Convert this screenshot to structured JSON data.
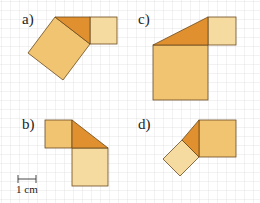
{
  "figure": {
    "grid": {
      "spacing_px": 9,
      "color": "#d9d9d9"
    },
    "colors": {
      "triangle": "#e0902e",
      "square_medium": "#f0c470",
      "square_light": "#f5dba0",
      "stroke": "#6b4a1e"
    },
    "scale_bar": {
      "label": "1 cm"
    },
    "panels": [
      {
        "id": "a",
        "label": "a)"
      },
      {
        "id": "b",
        "label": "b)"
      },
      {
        "id": "c",
        "label": "c)"
      },
      {
        "id": "d",
        "label": "d)"
      }
    ]
  }
}
